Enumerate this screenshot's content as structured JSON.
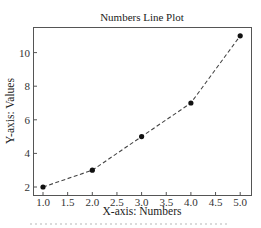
{
  "chart_data": {
    "type": "line",
    "title": "Numbers Line Plot",
    "xlabel": "X-axis: Numbers",
    "ylabel": "Y-axis: Values",
    "x": [
      1.0,
      2.0,
      3.0,
      4.0,
      5.0
    ],
    "series": [
      {
        "name": "Values",
        "values": [
          2,
          3,
          5,
          7,
          11
        ],
        "line_style": "dashed",
        "marker": "circle",
        "color": "#111111"
      }
    ],
    "xticks": [
      "1.0",
      "1.5",
      "2.0",
      "2.5",
      "3.0",
      "3.5",
      "4.0",
      "4.5",
      "5.0"
    ],
    "yticks": [
      "2",
      "4",
      "6",
      "8",
      "10"
    ],
    "xlim": [
      0.9,
      5.12
    ],
    "ylim": [
      1.5,
      11.45
    ],
    "grid": false,
    "legend": null
  }
}
